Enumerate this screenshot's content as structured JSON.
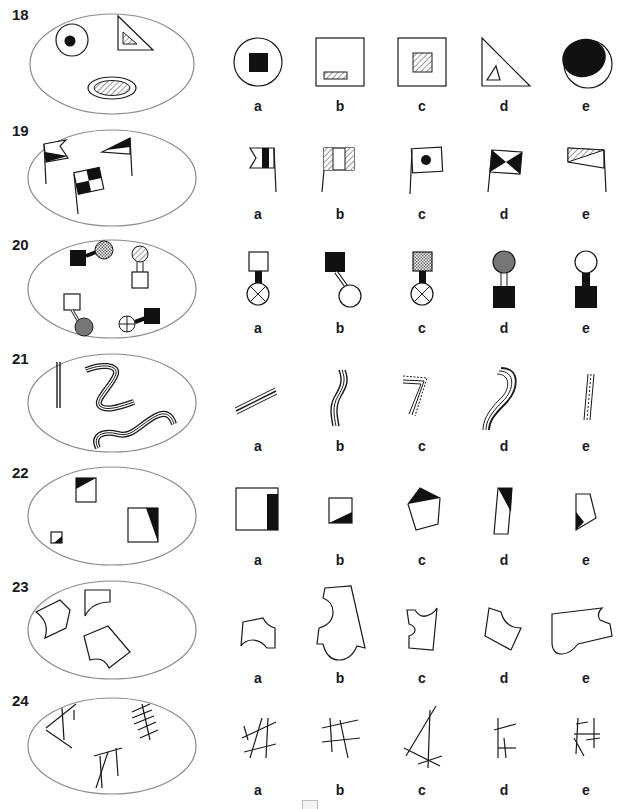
{
  "problems": [
    {
      "number": "18",
      "options": [
        "a",
        "b",
        "c",
        "d",
        "e"
      ]
    },
    {
      "number": "19",
      "options": [
        "a",
        "b",
        "c",
        "d",
        "e"
      ]
    },
    {
      "number": "20",
      "options": [
        "a",
        "b",
        "c",
        "d",
        "e"
      ]
    },
    {
      "number": "21",
      "options": [
        "a",
        "b",
        "c",
        "d",
        "e"
      ]
    },
    {
      "number": "22",
      "options": [
        "a",
        "b",
        "c",
        "d",
        "e"
      ]
    },
    {
      "number": "23",
      "options": [
        "a",
        "b",
        "c",
        "d",
        "e"
      ]
    },
    {
      "number": "24",
      "options": [
        "a",
        "b",
        "c",
        "d",
        "e"
      ]
    }
  ],
  "colors": {
    "stroke": "#1a1a1a",
    "oval": "#8a8a8a",
    "gray_fill": "#7a7a7a"
  }
}
